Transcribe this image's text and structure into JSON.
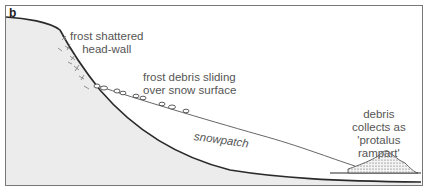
{
  "panel": {
    "letter": "b"
  },
  "labels": {
    "headwall": [
      "frost shattered",
      "head-wall"
    ],
    "debris_sliding": [
      "frost debris sliding",
      "over snow surface"
    ],
    "snowpatch": "snowpatch",
    "rampart": [
      "debris",
      "collects as",
      "'protalus",
      "rampart'"
    ]
  },
  "colors": {
    "ground_fill": "#ececec",
    "outline": "#2a2a2a",
    "text": "#555555",
    "frame": "#777777"
  }
}
